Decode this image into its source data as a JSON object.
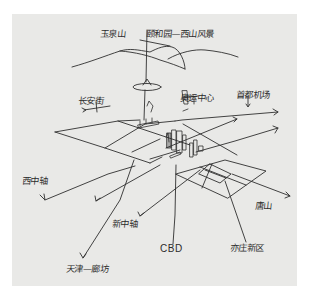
{
  "diagram": {
    "type": "hand-drawn urban planning sketch",
    "background_color": "#e9e9e7",
    "ink_color": "#2b2b2b",
    "labels": {
      "mountain": "玉泉山",
      "summer_palace": "颐和园—西山风景",
      "left_upper": "长安街",
      "center_upper": "奥运中心",
      "right_upper": "首都机场",
      "west_axis": "西中轴",
      "new_axis": "新中轴",
      "cbd": "CBD",
      "right_side": "唐山",
      "new_district": "亦庄新区",
      "bottom_left": "天津—廊坊"
    }
  }
}
